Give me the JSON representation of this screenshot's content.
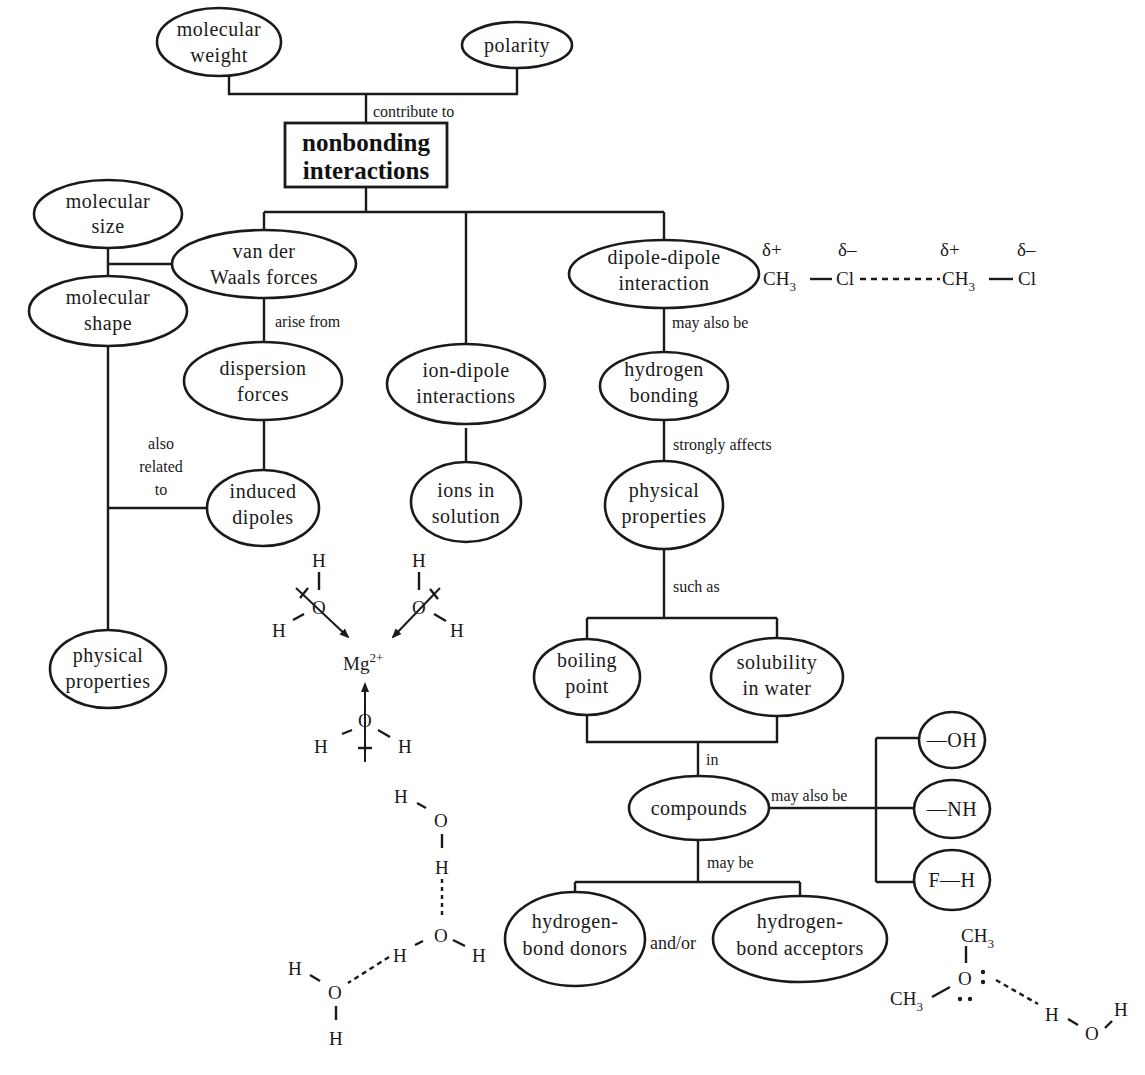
{
  "title": {
    "line1": "nonbonding",
    "line2": "interactions"
  },
  "nodes": {
    "molecular_weight": {
      "line1": "molecular",
      "line2": "weight"
    },
    "polarity": {
      "line1": "polarity"
    },
    "molecular_size": {
      "line1": "molecular",
      "line2": "size"
    },
    "molecular_shape": {
      "line1": "molecular",
      "line2": "shape"
    },
    "van_der_waals": {
      "line1": "van der",
      "line2": "Waals forces"
    },
    "dispersion_forces": {
      "line1": "dispersion",
      "line2": "forces"
    },
    "induced_dipoles": {
      "line1": "induced",
      "line2": "dipoles"
    },
    "physical_properties_left": {
      "line1": "physical",
      "line2": "properties"
    },
    "ion_dipole": {
      "line1": "ion-dipole",
      "line2": "interactions"
    },
    "ions_in_solution": {
      "line1": "ions in",
      "line2": "solution"
    },
    "dipole_dipole": {
      "line1": "dipole-dipole",
      "line2": "interaction"
    },
    "hydrogen_bonding": {
      "line1": "hydrogen",
      "line2": "bonding"
    },
    "physical_properties_right": {
      "line1": "physical",
      "line2": "properties"
    },
    "boiling_point": {
      "line1": "boiling",
      "line2": "point"
    },
    "solubility": {
      "line1": "solubility",
      "line2": "in water"
    },
    "compounds": {
      "line1": "compounds"
    },
    "oh_group": {
      "line1": "—OH"
    },
    "nh_group": {
      "line1": "—NH"
    },
    "fh_group": {
      "line1": "F—H"
    },
    "hb_donors": {
      "line1": "hydrogen-",
      "line2": "bond donors"
    },
    "hb_acceptors": {
      "line1": "hydrogen-",
      "line2": "bond acceptors"
    }
  },
  "edge_labels": {
    "contribute_to": "contribute to",
    "arise_from": "arise from",
    "also_related_to": {
      "line1": "also",
      "line2": "related",
      "line3": "to"
    },
    "may_also_be_1": "may also be",
    "strongly_affects": "strongly affects",
    "such_as": "such as",
    "in": "in",
    "may_also_be_2": "may also be",
    "may_be": "may be",
    "and_or": "and/or"
  },
  "chemistry": {
    "dipole_example": {
      "delta_plus": "δ+",
      "delta_minus": "δ–",
      "ch3": "CH",
      "sub3": "3",
      "cl": "Cl"
    },
    "mg_complex": {
      "ion": "Mg",
      "charge": "2+",
      "o": "O",
      "h": "H"
    },
    "water_chain": {
      "o": "O",
      "h": "H"
    },
    "ether_water": {
      "ch3": "CH",
      "sub3": "3",
      "o": "O",
      "h": "H",
      "lone_pair": "••"
    }
  }
}
